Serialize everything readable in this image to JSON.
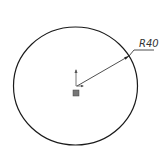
{
  "drawing": {
    "dimension_label": "R40",
    "entities": [
      {
        "type": "circle",
        "name": "sketch-circle"
      },
      {
        "type": "radius-dimension",
        "name": "radius-dimension",
        "value": "R40"
      },
      {
        "type": "origin",
        "name": "sketch-origin"
      }
    ]
  }
}
